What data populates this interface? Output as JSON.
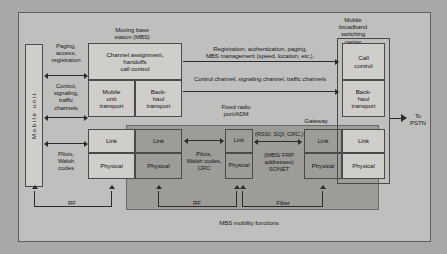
{
  "diagram": {
    "title_left": "Moving base\nstation (MBS)",
    "title_right": "Mobile\nbroadband\nswitching\ncenter",
    "mobile_unit": "M o b i l e    u n i t",
    "mobile_unit_plain": "Mobile unit",
    "mbs": {
      "control": "Channel assignment,\nhandoffs\ncall control",
      "mobile_transport": "Mobile\nunit\ntransport",
      "backhaul_transport": "Back-\nhaul\ntransport",
      "link_left": "Link",
      "link_right": "Link",
      "physical_left": "Physical",
      "physical_right": "Physical"
    },
    "frp": {
      "title": "Fixed radio\nport/ADM",
      "link": "Link",
      "physical": "Physical"
    },
    "gateway": {
      "title": "Gateway",
      "link": "Link",
      "physical": "Physical"
    },
    "mbsc": {
      "call_control": "Call\ncontrol",
      "backhaul_transport": "Back-\nhaul\ntransport",
      "link": "Link",
      "physical": "Physical"
    },
    "interface_labels": {
      "paging": "Paging,\naccess,\nregistration",
      "control_signaling": "Control,\nsignaling,\ntraffic\nchannels",
      "pilots_walsh": "Pilots,\nWalsh\ncodes",
      "pilots_walsh_crc": "Pilots,\nWalsh codes,\nCRC",
      "rssi": "(RSSI, SQI, CRC,)",
      "sonet": "(MBS/ FRP\naddresses)\nSONET",
      "registration": "Registration, authentication, paging,\nMBS management (speed, location, etc.),",
      "control_channel": "Control channel, signaling channel, traffic channels"
    },
    "media": {
      "rf_left": "RF",
      "rf_right": "RF",
      "fiber": "Fiber"
    },
    "mobility": "MBS mobility functions",
    "to_pstn": "To\nPSTN",
    "colors": {
      "page_bg": "#a9a8a6",
      "canvas_bg": "#bfbfbd",
      "box_light": "#cfcecb",
      "box_medium": "#b4b3b0",
      "box_dark": "#9d9c99",
      "line": "#2b2b2b",
      "text": "#131313"
    }
  }
}
